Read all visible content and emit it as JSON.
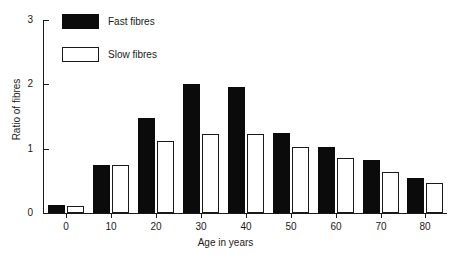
{
  "chart_data": {
    "type": "bar",
    "title": "",
    "subtitle": "",
    "xlabel": "Age in years",
    "ylabel": "Ratio of fibres",
    "categories": [
      "0",
      "10",
      "20",
      "30",
      "40",
      "50",
      "60",
      "70",
      "80"
    ],
    "xticks": [
      0,
      10,
      20,
      30,
      40,
      50,
      60,
      70,
      80
    ],
    "yticks": [
      0,
      1,
      2,
      3
    ],
    "ytick_labels": [
      "0",
      "1",
      "2",
      "3"
    ],
    "ylim": [
      0,
      3
    ],
    "grid": false,
    "legend_position": "upper-left-inside",
    "series": [
      {
        "name": "Fast fibres",
        "color": "#0b0b0b",
        "style": "filled",
        "values": [
          0.13,
          0.75,
          1.48,
          2.0,
          1.96,
          1.24,
          1.02,
          0.83,
          0.54
        ]
      },
      {
        "name": "Slow fibres",
        "color": "#ffffff",
        "style": "outlined",
        "values": [
          0.11,
          0.75,
          1.12,
          1.23,
          1.23,
          1.02,
          0.85,
          0.63,
          0.47
        ]
      }
    ]
  },
  "legend": {
    "items": [
      {
        "label": "Fast fibres",
        "swatch": "filled-black"
      },
      {
        "label": "Slow fibres",
        "swatch": "outlined-white"
      }
    ]
  },
  "axes": {
    "y_title": "Ratio of fibres",
    "x_title": "Age in years"
  }
}
